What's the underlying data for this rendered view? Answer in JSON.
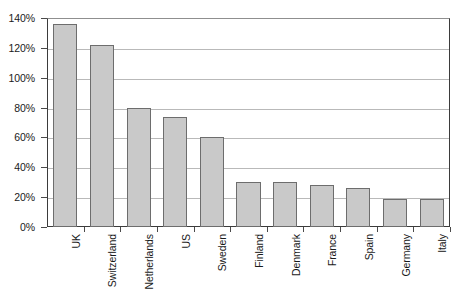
{
  "chart_data": {
    "type": "bar",
    "title": "",
    "subtitle": "",
    "xlabel": "",
    "ylabel": "",
    "orientation": "vertical",
    "grid": true,
    "legend": false,
    "legend_position": "none",
    "ylim": [
      0,
      140
    ],
    "ytick_labels": [
      "0%",
      "20%",
      "40%",
      "60%",
      "80%",
      "100%",
      "120%",
      "140%"
    ],
    "ytick_values": [
      0,
      20,
      40,
      60,
      80,
      100,
      120,
      140
    ],
    "value_unit": "%",
    "categories": [
      "UK",
      "Switzerland",
      "Netherlands",
      "US",
      "Sweden",
      "Finland",
      "Denmark",
      "France",
      "Spain",
      "Germany",
      "Italy"
    ],
    "values": [
      136,
      122,
      80,
      74,
      60,
      30,
      30,
      28,
      26,
      19,
      19
    ],
    "series": [
      {
        "name": "",
        "values": [
          136,
          122,
          80,
          74,
          60,
          30,
          30,
          28,
          26,
          19,
          19
        ]
      }
    ],
    "colors": {
      "bar_fill": "#c9c9c9",
      "bar_border": "#6d6d6d",
      "gridline": "#b9b9b9",
      "axis": "#3b3b3b",
      "text": "#1a1a1a",
      "background": "#ffffff"
    }
  },
  "caption_ghost": ""
}
